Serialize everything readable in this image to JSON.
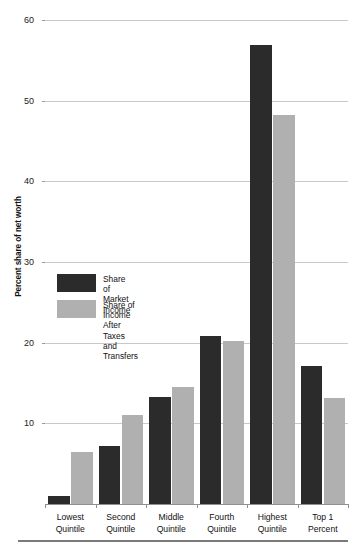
{
  "chart_data": {
    "type": "bar",
    "title": "",
    "subtitle": "",
    "xlabel": "",
    "ylabel": "Percent share of net worth",
    "ylim": [
      0,
      60
    ],
    "yticks": [
      10,
      20,
      30,
      40,
      50,
      60
    ],
    "ytick_labels": [
      "10",
      "20",
      "30",
      "40",
      "50",
      "60"
    ],
    "grid": true,
    "legend_position": "inside-left-middle",
    "categories": [
      "Lowest\nQuintile",
      "Second\nQuintile",
      "Middle\nQuintile",
      "Fourth\nQuintile",
      "Highest\nQuintile",
      "Top 1 Percent"
    ],
    "series": [
      {
        "name": "Share of\nMarket Income",
        "color": "#2b2b2b",
        "values": [
          1.0,
          7.2,
          13.3,
          20.8,
          56.9,
          17.1
        ]
      },
      {
        "name": "Share of Income After\nTaxes and Transfers",
        "color": "#b0b0b0",
        "values": [
          6.5,
          11.0,
          14.5,
          20.2,
          48.2,
          13.2
        ]
      }
    ]
  },
  "legend": {
    "items": [
      {
        "label": "Share of\nMarket Income",
        "color": "#2b2b2b"
      },
      {
        "label": "Share of Income After\nTaxes and Transfers",
        "color": "#b0b0b0"
      }
    ]
  },
  "colors": {
    "series_dark": "#2b2b2b",
    "series_light": "#b0b0b0",
    "gridline": "#c9c9c9",
    "axis": "#8f8f8f",
    "background": "#ffffff",
    "text": "#111111"
  }
}
